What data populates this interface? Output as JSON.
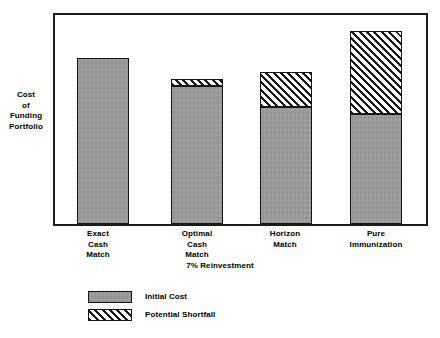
{
  "chart_data": {
    "type": "bar",
    "subtype": "stacked",
    "title": "",
    "xlabel": "7% Reinvestment",
    "ylabel": "Cost of Funding Portfolio",
    "ylabel_lines": [
      "Cost",
      "of",
      "Funding",
      "Portfolio"
    ],
    "categories": [
      "Exact Cash Match",
      "Optimal Cash Match",
      "Horizon Match",
      "Pure Immunization"
    ],
    "category_label_lines": [
      [
        "Exact",
        "Cash",
        "Match"
      ],
      [
        "Optimal",
        "Cash",
        "Match"
      ],
      [
        "Horizon",
        "Match"
      ],
      [
        "Pure",
        "Immunization"
      ]
    ],
    "series": [
      {
        "name": "Initial Cost",
        "fill": "solid-gray",
        "color": "#9c9c9c",
        "values": [
          79.5,
          65.8,
          56.0,
          52.5
        ]
      },
      {
        "name": "Potential Shortfall",
        "fill": "diagonal-hatch",
        "color": "#ffffff",
        "values": [
          0.0,
          3.8,
          16.5,
          39.9
        ]
      }
    ],
    "totals": [
      79.5,
      69.6,
      72.5,
      92.4
    ],
    "ylim": [
      0,
      100
    ],
    "axis_tick_labels_y": [],
    "grid": false,
    "legend_position": "below-plot-left",
    "legend_entries": [
      "Initial Cost",
      "Potential Shortfall"
    ]
  },
  "legend": {
    "items": [
      {
        "label": "Initial Cost",
        "swatch": "solid-gray-swatch"
      },
      {
        "label": "Potential Shortfall",
        "swatch": "hatched-swatch"
      }
    ]
  },
  "colors": {
    "background": "#ffffff",
    "frame": "#1b1b1b",
    "bar_outline": "#141414",
    "initial_cost_fill": "#9c9c9c",
    "shortfall_fill": "#ffffff",
    "shortfall_hatch": "#171717",
    "text": "#000000"
  }
}
